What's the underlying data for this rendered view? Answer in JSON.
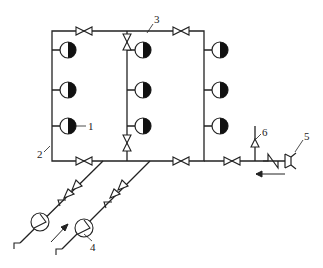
{
  "diagram": {
    "type": "piping-schematic",
    "labels": [
      {
        "id": "1",
        "text": "1",
        "refers_to": "outlet head"
      },
      {
        "id": "2",
        "text": "2",
        "refers_to": "ring main pipe"
      },
      {
        "id": "3",
        "text": "3",
        "refers_to": "top pipe"
      },
      {
        "id": "4",
        "text": "4",
        "refers_to": "pump"
      },
      {
        "id": "5",
        "text": "5",
        "refers_to": "inlet connector"
      },
      {
        "id": "6",
        "text": "6",
        "refers_to": "vent/relief valve"
      }
    ],
    "colors": {
      "line": "#222222",
      "background": "#ffffff"
    }
  }
}
